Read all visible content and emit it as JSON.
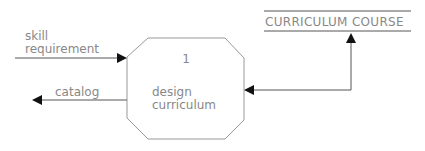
{
  "diagram": {
    "type": "data-flow-diagram",
    "process": {
      "number": "1",
      "label_line1": "design",
      "label_line2": "curriculum"
    },
    "data_store": {
      "label": "CURRICULUM COURSE"
    },
    "flows": [
      {
        "id": "input",
        "label_line1": "skill",
        "label_line2": "requirement",
        "direction": "into process"
      },
      {
        "id": "output",
        "label": "catalog",
        "direction": "out of process"
      },
      {
        "id": "store-link",
        "label": "",
        "direction": "bidirectional between process and data store"
      }
    ],
    "colors": {
      "line": "#555555",
      "text": "#888888",
      "arrowhead": "#111111",
      "shape_border": "#999999"
    }
  }
}
